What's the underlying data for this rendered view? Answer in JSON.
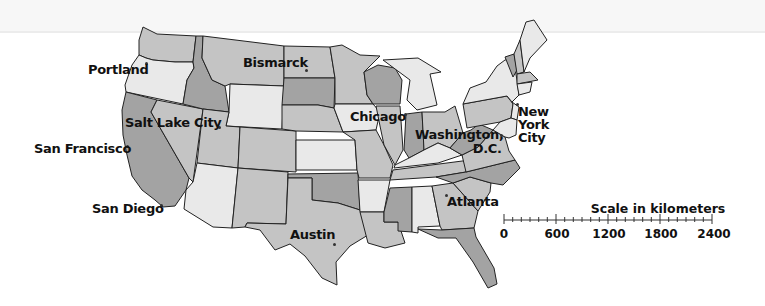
{
  "map": {
    "type": "political map",
    "subject": "Contiguous United States",
    "fills": {
      "light": "#e9e9e9",
      "medium": "#c4c4c4",
      "dark": "#a3a3a3",
      "border": "#222222"
    },
    "cities": [
      {
        "name": "Portland",
        "x": 88,
        "y": 70
      },
      {
        "name": "Bismarck",
        "x": 243,
        "y": 57
      },
      {
        "name": "Salt Lake City",
        "x": 124,
        "y": 116
      },
      {
        "name": "San Francisco",
        "x": 34,
        "y": 141
      },
      {
        "name": "San Diego",
        "x": 92,
        "y": 202
      },
      {
        "name": "Chicago",
        "x": 406,
        "y": 110
      },
      {
        "name": "Washington, D.C.",
        "x": 416,
        "y": 127
      },
      {
        "name": "New York City",
        "x": 518,
        "y": 107
      },
      {
        "name": "Atlanta",
        "x": 446,
        "y": 194
      },
      {
        "name": "Austin",
        "x": 290,
        "y": 227
      }
    ]
  },
  "scale": {
    "title": "Scale in kilometers",
    "ticks": [
      "0",
      "600",
      "1200",
      "1800",
      "2400"
    ],
    "unit": "kilometers",
    "max": 2400
  }
}
